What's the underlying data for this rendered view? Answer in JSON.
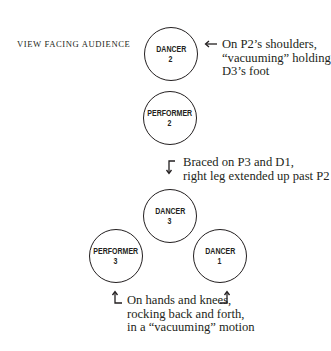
{
  "caption": "VIEW FACING AUDIENCE",
  "figures": [
    {
      "id": "dancer-2",
      "line1": "DANCER",
      "line2": "2"
    },
    {
      "id": "performer-2",
      "line1": "PERFORMER",
      "line2": "2"
    },
    {
      "id": "dancer-3",
      "line1": "DANCER",
      "line2": "3"
    },
    {
      "id": "performer-3",
      "line1": "PERFORMER",
      "line2": "3"
    },
    {
      "id": "dancer-1",
      "line1": "DANCER",
      "line2": "1"
    }
  ],
  "notes": {
    "dancer2": {
      "arrow": "arrow-left-icon",
      "lines": [
        "On P2’s shoulders,",
        "“vacuuming” holding",
        "D3’s foot"
      ]
    },
    "dancer3": {
      "arrow": "arrow-turn-down-icon",
      "lines": [
        "Braced on P3 and D1,",
        "right leg extended up past P2"
      ]
    },
    "base": {
      "arrows": [
        "arrow-turn-up-left-icon",
        "arrow-turn-up-right-icon"
      ],
      "lines": [
        "On hands and knees,",
        "rocking back and forth,",
        "in a “vacuuming” motion"
      ]
    }
  },
  "colors": {
    "ink": "#231f20",
    "background": "#ffffff"
  }
}
